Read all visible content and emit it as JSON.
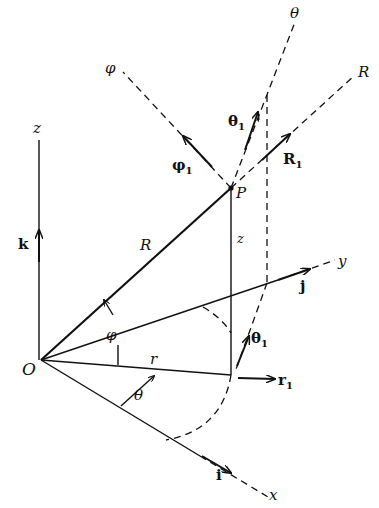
{
  "figure": {
    "points": {
      "origin": {
        "label": "O"
      },
      "point": {
        "label": "P"
      }
    },
    "axes": {
      "z": {
        "label": "z",
        "unit_vector": "k"
      },
      "y": {
        "label": "y",
        "unit_vector": "j"
      },
      "x": {
        "label": "x",
        "unit_vector": "i"
      }
    },
    "coordinate_lines": {
      "theta": {
        "label": "θ"
      },
      "phi": {
        "label": "φ"
      },
      "R": {
        "label": "R"
      }
    },
    "unit_vectors": {
      "theta1_top": {
        "label": "θ",
        "subscript": "1"
      },
      "phi1": {
        "label": "φ",
        "subscript": "1"
      },
      "R1": {
        "label": "R",
        "subscript": "1"
      },
      "theta1_bottom": {
        "label": "θ",
        "subscript": "1"
      },
      "r1": {
        "label": "r",
        "subscript": "1"
      }
    },
    "segments": {
      "R": {
        "label": "R"
      },
      "z": {
        "label": "z"
      },
      "r": {
        "label": "r"
      }
    },
    "angles": {
      "phi": {
        "label": "φ"
      },
      "theta": {
        "label": "θ"
      }
    }
  }
}
